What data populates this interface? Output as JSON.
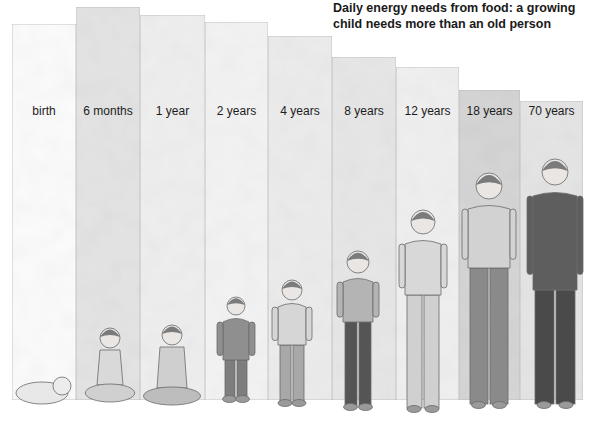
{
  "chart_data": {
    "type": "bar",
    "title": "Daily energy needs from food: a growing child needs more than an old person",
    "xlabel": "",
    "ylabel": "",
    "y_axis_shown": false,
    "grid": false,
    "legend": "none",
    "value_units": "relative height (scale not shown)",
    "categories": [
      "birth",
      "6 months",
      "1 year",
      "2 years",
      "4 years",
      "8 years",
      "12 years",
      "18 years",
      "70 years"
    ],
    "values": [
      376,
      393,
      385,
      378,
      364,
      343,
      333,
      310,
      299
    ],
    "ylim": [
      0,
      400
    ],
    "bar_shades": [
      "#fbfbfb",
      "#e3e3e3",
      "#eeeeee",
      "#f3f3f3",
      "#ebebeb",
      "#e6e6e6",
      "#efefef",
      "#d4d4d4",
      "#e4e4e4"
    ],
    "illustrations": [
      "infant lying down",
      "baby sitting",
      "toddler sitting",
      "young child standing",
      "child standing",
      "boy standing",
      "boy leaning",
      "young woman",
      "older man in suit"
    ]
  }
}
